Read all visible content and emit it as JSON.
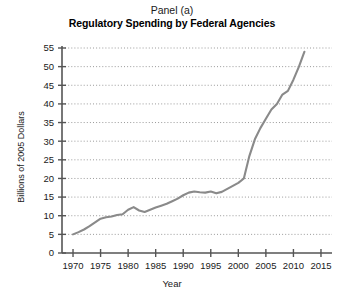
{
  "chart_data": {
    "type": "line",
    "title": "Regulatory Spending by Federal Agencies",
    "panel_label": "Panel (a)",
    "xlabel": "Year",
    "ylabel": "Billions of 2005 Dollars",
    "xlim": [
      1968,
      2017
    ],
    "ylim": [
      0,
      55
    ],
    "xticks": [
      1970,
      1975,
      1980,
      1985,
      1990,
      1995,
      2000,
      2005,
      2010,
      2015
    ],
    "yticks": [
      0,
      5,
      10,
      15,
      20,
      25,
      30,
      35,
      40,
      45,
      50,
      55
    ],
    "grid": "horizontal-dotted",
    "legend": "none",
    "line_color": "#8a8a8a",
    "axis_color": "#555555",
    "series": [
      {
        "name": "Regulatory Spending",
        "x": [
          1970,
          1971,
          1972,
          1973,
          1974,
          1975,
          1976,
          1977,
          1978,
          1979,
          1980,
          1981,
          1982,
          1983,
          1984,
          1985,
          1986,
          1987,
          1988,
          1989,
          1990,
          1991,
          1992,
          1993,
          1994,
          1995,
          1996,
          1997,
          1998,
          1999,
          2000,
          2001,
          2002,
          2003,
          2004,
          2005,
          2006,
          2007,
          2008,
          2009,
          2010,
          2011,
          2012
        ],
        "values": [
          5.0,
          5.6,
          6.3,
          7.2,
          8.2,
          9.2,
          9.6,
          9.8,
          10.2,
          10.4,
          11.6,
          12.3,
          11.4,
          11.0,
          11.6,
          12.2,
          12.7,
          13.2,
          13.9,
          14.6,
          15.5,
          16.2,
          16.5,
          16.3,
          16.2,
          16.5,
          16.0,
          16.4,
          17.2,
          18.0,
          18.8,
          20.0,
          26.0,
          30.5,
          33.5,
          36.0,
          38.5,
          40.0,
          42.5,
          43.5,
          46.5,
          50.0,
          54.0
        ]
      }
    ]
  },
  "axis_geometry": {
    "plot_left": 62,
    "plot_right": 332,
    "plot_top": 48,
    "plot_bottom": 253
  }
}
